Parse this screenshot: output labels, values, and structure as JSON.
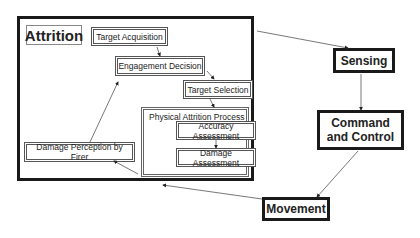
{
  "diagram": {
    "attrition_container": {
      "title": "Attrition"
    },
    "nodes": {
      "target_acquisition": "Target Acquisition",
      "engagement_decision": "Engagement Decision",
      "target_selection": "Target Selection",
      "physical_attrition_process": "Physical Attrition Process",
      "accuracy_assessment": "Accuracy Assessment",
      "damage_assessment": "Damage Assessment",
      "damage_perception": "Damage Perception by Firer",
      "sensing": "Sensing",
      "command_and_control": "Command and Control",
      "movement": "Movement"
    },
    "edges": [
      {
        "from": "Target Acquisition",
        "to": "Engagement Decision"
      },
      {
        "from": "Engagement Decision",
        "to": "Target Selection"
      },
      {
        "from": "Target Selection",
        "to": "Physical Attrition Process"
      },
      {
        "from": "Accuracy Assessment",
        "to": "Damage Assessment"
      },
      {
        "from": "Physical Attrition Process",
        "to": "Damage Perception by Firer"
      },
      {
        "from": "Damage Perception by Firer",
        "to": "Engagement Decision"
      },
      {
        "from": "Attrition",
        "to": "Sensing"
      },
      {
        "from": "Sensing",
        "to": "Command and Control"
      },
      {
        "from": "Command and Control",
        "to": "Movement"
      },
      {
        "from": "Movement",
        "to": "Attrition"
      }
    ],
    "colors": {
      "border_dark": "#1a1a1a",
      "border_gray": "#666666",
      "background": "#ffffff"
    }
  }
}
